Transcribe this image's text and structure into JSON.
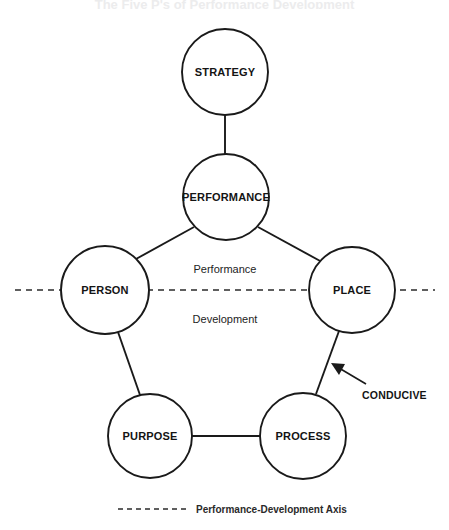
{
  "page": {
    "background_color": "#ffffff",
    "ink_color": "#1a1a1a",
    "width": 449,
    "height": 530,
    "cropped_header_text": "The Five P's of Performance Development"
  },
  "diagram": {
    "type": "pentagon-node-diagram",
    "title_visible": false,
    "nodes": [
      {
        "id": "strategy",
        "label": "STRATEGY",
        "cx": 225,
        "cy": 72,
        "r": 43
      },
      {
        "id": "performance",
        "label": "PERFORMANCE",
        "cx": 226,
        "cy": 197,
        "r": 43
      },
      {
        "id": "person",
        "label": "PERSON",
        "cx": 105,
        "cy": 290,
        "r": 44
      },
      {
        "id": "place",
        "label": "PLACE",
        "cx": 352,
        "cy": 290,
        "r": 43
      },
      {
        "id": "purpose",
        "label": "PURPOSE",
        "cx": 150,
        "cy": 436,
        "r": 42
      },
      {
        "id": "process",
        "label": "PROCESS",
        "cx": 303,
        "cy": 436,
        "r": 43
      }
    ],
    "edges": [
      {
        "id": "strategy-performance",
        "from": "strategy",
        "to": "performance",
        "x1": 225,
        "y1": 115,
        "x2": 225,
        "y2": 154
      },
      {
        "id": "performance-person",
        "from": "performance",
        "to": "person",
        "x1": 194,
        "y1": 227,
        "x2": 136,
        "y2": 259
      },
      {
        "id": "performance-place",
        "from": "performance",
        "to": "place",
        "x1": 258,
        "y1": 227,
        "x2": 322,
        "y2": 262
      },
      {
        "id": "person-purpose",
        "from": "person",
        "to": "purpose",
        "x1": 118,
        "y1": 332,
        "x2": 140,
        "y2": 395
      },
      {
        "id": "place-process",
        "from": "place",
        "to": "process",
        "x1": 339,
        "y1": 331,
        "x2": 316,
        "y2": 394
      },
      {
        "id": "purpose-process",
        "from": "purpose",
        "to": "process",
        "x1": 192,
        "y1": 436,
        "x2": 260,
        "y2": 436
      }
    ],
    "axis": {
      "id": "performance-development-axis",
      "y": 290,
      "x_start": 15,
      "x_end": 435,
      "style": "dashed",
      "color": "#2b2b2b",
      "upper_label": "Performance",
      "upper_label_x": 225,
      "upper_label_y": 269,
      "lower_label": "Development",
      "lower_label_x": 225,
      "lower_label_y": 319
    },
    "callout": {
      "id": "conducive-callout",
      "label": "CONDUCIVE",
      "label_x": 362,
      "label_y": 395,
      "arrow_tail_x": 366,
      "arrow_tail_y": 384,
      "arrow_tip_x": 332,
      "arrow_tip_y": 364,
      "points_at_edge": "place-process"
    },
    "legend": {
      "id": "axis-legend",
      "label": "Performance-Development Axis",
      "label_x": 196,
      "label_y": 509,
      "line_x_start": 118,
      "line_x_end": 188,
      "line_y": 509,
      "style": "dashed"
    }
  }
}
